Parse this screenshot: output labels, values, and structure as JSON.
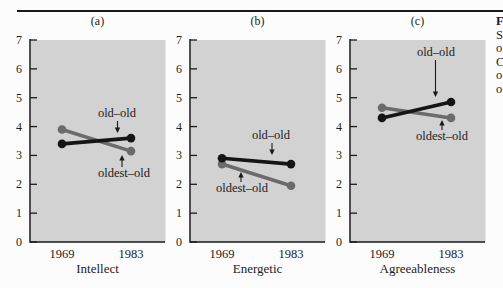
{
  "figure": {
    "caption_fragments": [
      "F",
      "S",
      "o",
      "C",
      "o",
      "o"
    ]
  },
  "colors": {
    "page_bg": "#fcfcfc",
    "plot_bg": "#d2d2d2",
    "axis": "#1a1a1a",
    "text": "#1c1c1c",
    "rule": "#1a1a1a",
    "old_old": "#151515",
    "oldest_old": "#6b6b6b"
  },
  "chart_data": [
    {
      "type": "line",
      "panel_label": "(a)",
      "categories": [
        "1969",
        "1983"
      ],
      "series": [
        {
          "name": "old–old",
          "values": [
            3.4,
            3.6
          ]
        },
        {
          "name": "oldest–old",
          "values": [
            3.9,
            3.15
          ]
        }
      ],
      "xlabel": "Intellect",
      "ylabel": "",
      "ylim": [
        0,
        7
      ],
      "ytick_step": 1,
      "grid": false,
      "legend": "inline-arrow-annotations"
    },
    {
      "type": "line",
      "panel_label": "(b)",
      "categories": [
        "1969",
        "1983"
      ],
      "series": [
        {
          "name": "old–old",
          "values": [
            2.9,
            2.7
          ]
        },
        {
          "name": "oldest–old",
          "values": [
            2.7,
            1.95
          ]
        }
      ],
      "xlabel": "Energetic",
      "ylabel": "",
      "ylim": [
        0,
        7
      ],
      "ytick_step": 1,
      "grid": false,
      "legend": "inline-arrow-annotations"
    },
    {
      "type": "line",
      "panel_label": "(c)",
      "categories": [
        "1969",
        "1983"
      ],
      "series": [
        {
          "name": "old–old",
          "values": [
            4.3,
            4.85
          ]
        },
        {
          "name": "oldest–old",
          "values": [
            4.65,
            4.3
          ]
        }
      ],
      "xlabel": "Agreeableness",
      "ylabel": "",
      "ylim": [
        0,
        7
      ],
      "ytick_step": 1,
      "grid": false,
      "legend": "inline-arrow-annotations"
    }
  ]
}
